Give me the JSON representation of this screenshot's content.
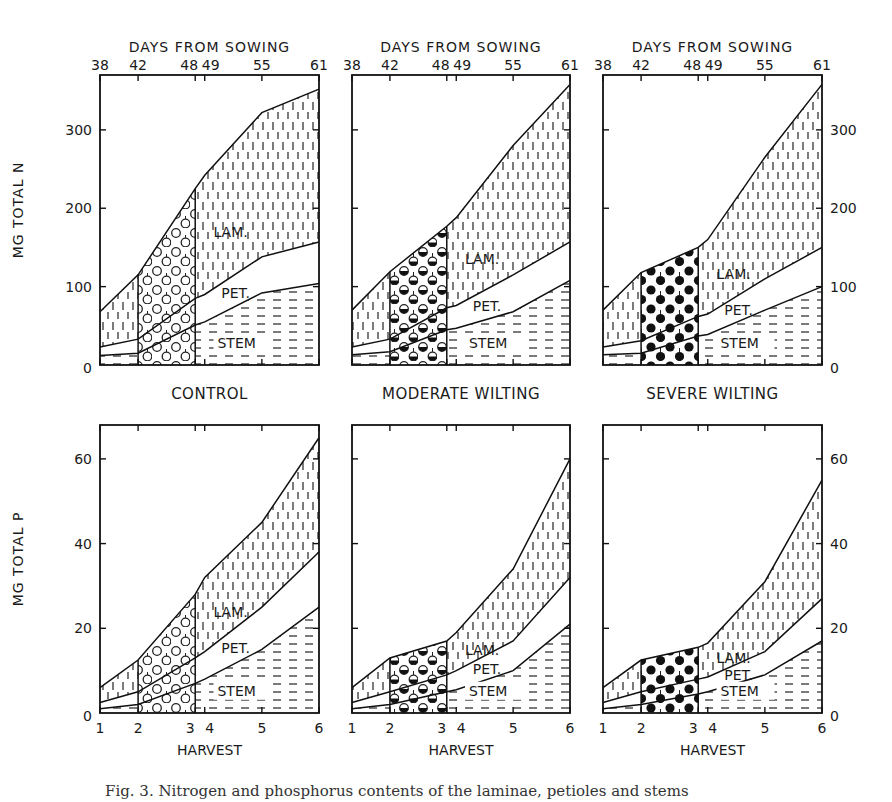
{
  "figure": {
    "treatments": [
      "CONTROL",
      "MODERATE WILTING",
      "SEVERE WILTING"
    ],
    "top_axis_title": "DAYS FROM SOWING",
    "top_axis_ticks": [
      "38",
      "42",
      "48",
      "49",
      "55",
      "61"
    ],
    "bottom_axis_title": "HARVEST",
    "bottom_axis_ticks": [
      "1",
      "2",
      "3",
      "4",
      "5",
      "6"
    ],
    "region_labels": {
      "lamina": "LAM.",
      "petiole": "PET.",
      "stem": "STEM"
    },
    "n_ylabel": "MG   TOTAL   N",
    "p_ylabel": "MG   TOTAL   P",
    "n_yticks": [
      "0",
      "100",
      "200",
      "300"
    ],
    "p_yticks": [
      "0",
      "20",
      "40",
      "60"
    ],
    "caption_partial": "Fig. 3. Nitrogen and phosphorus contents of the laminae, petioles and stems"
  },
  "chart_data": [
    {
      "type": "area",
      "title": "CONTROL",
      "nutrient": "N",
      "xlabel_top": "DAYS FROM SOWING",
      "xlabel": "HARVEST",
      "ylabel": "MG TOTAL N",
      "x": [
        1,
        2,
        3,
        4,
        5,
        6
      ],
      "days_from_sowing": [
        38,
        42,
        48,
        49,
        55,
        61
      ],
      "ylim": [
        0,
        370
      ],
      "stacked": true,
      "wilting_period_harvests": [
        2,
        3
      ],
      "series": [
        {
          "name": "STEM",
          "cumulative_top": [
            12,
            15,
            51,
            55,
            92,
            104
          ]
        },
        {
          "name": "PET.",
          "cumulative_top": [
            23,
            33,
            85,
            90,
            138,
            157
          ]
        },
        {
          "name": "LAM.",
          "cumulative_top": [
            68,
            115,
            225,
            242,
            322,
            352
          ]
        }
      ]
    },
    {
      "type": "area",
      "title": "MODERATE WILTING",
      "nutrient": "N",
      "xlabel_top": "DAYS FROM SOWING",
      "xlabel": "HARVEST",
      "ylabel": "MG TOTAL N",
      "x": [
        1,
        2,
        3,
        4,
        5,
        6
      ],
      "days_from_sowing": [
        38,
        42,
        48,
        49,
        55,
        61
      ],
      "ylim": [
        0,
        370
      ],
      "stacked": true,
      "wilting_period_harvests": [
        2,
        3
      ],
      "series": [
        {
          "name": "STEM",
          "cumulative_top": [
            13,
            17,
            45,
            47,
            68,
            108
          ]
        },
        {
          "name": "PET.",
          "cumulative_top": [
            23,
            33,
            73,
            76,
            115,
            157
          ]
        },
        {
          "name": "LAM.",
          "cumulative_top": [
            70,
            119,
            177,
            188,
            280,
            358
          ]
        }
      ]
    },
    {
      "type": "area",
      "title": "SEVERE WILTING",
      "nutrient": "N",
      "xlabel_top": "DAYS FROM SOWING",
      "xlabel": "HARVEST",
      "ylabel": "MG TOTAL N",
      "x": [
        1,
        2,
        3,
        4,
        5,
        6
      ],
      "days_from_sowing": [
        38,
        42,
        48,
        49,
        55,
        61
      ],
      "ylim": [
        0,
        370
      ],
      "stacked": true,
      "wilting_period_harvests": [
        2,
        3
      ],
      "series": [
        {
          "name": "STEM",
          "cumulative_top": [
            13,
            15,
            37,
            39,
            70,
            100
          ]
        },
        {
          "name": "PET.",
          "cumulative_top": [
            23,
            31,
            62,
            65,
            110,
            150
          ]
        },
        {
          "name": "LAM.",
          "cumulative_top": [
            70,
            118,
            150,
            160,
            265,
            358
          ]
        }
      ]
    },
    {
      "type": "area",
      "title": "CONTROL",
      "nutrient": "P",
      "xlabel": "HARVEST",
      "ylabel": "MG TOTAL P",
      "x": [
        1,
        2,
        3,
        4,
        5,
        6
      ],
      "ylim": [
        0,
        68
      ],
      "stacked": true,
      "wilting_period_harvests": [
        2,
        3
      ],
      "series": [
        {
          "name": "STEM",
          "cumulative_top": [
            1,
            2,
            7,
            8,
            15,
            25
          ]
        },
        {
          "name": "PET.",
          "cumulative_top": [
            2.5,
            5,
            13,
            14.5,
            25,
            38
          ]
        },
        {
          "name": "LAM.",
          "cumulative_top": [
            6,
            12.5,
            28,
            32,
            45,
            65
          ]
        }
      ]
    },
    {
      "type": "area",
      "title": "MODERATE WILTING",
      "nutrient": "P",
      "xlabel": "HARVEST",
      "ylabel": "MG TOTAL P",
      "x": [
        1,
        2,
        3,
        4,
        5,
        6
      ],
      "ylim": [
        0,
        68
      ],
      "stacked": true,
      "wilting_period_harvests": [
        2,
        3
      ],
      "series": [
        {
          "name": "STEM",
          "cumulative_top": [
            1,
            2,
            5,
            5.5,
            10,
            21
          ]
        },
        {
          "name": "PET.",
          "cumulative_top": [
            2.5,
            5,
            9,
            10,
            17,
            32
          ]
        },
        {
          "name": "LAM.",
          "cumulative_top": [
            6,
            13,
            17,
            19,
            34,
            60
          ]
        }
      ]
    },
    {
      "type": "area",
      "title": "SEVERE WILTING",
      "nutrient": "P",
      "xlabel": "HARVEST",
      "ylabel": "MG TOTAL P",
      "x": [
        1,
        2,
        3,
        4,
        5,
        6
      ],
      "ylim": [
        0,
        68
      ],
      "stacked": true,
      "wilting_period_harvests": [
        2,
        3
      ],
      "series": [
        {
          "name": "STEM",
          "cumulative_top": [
            1,
            2,
            4.5,
            5,
            9,
            17
          ]
        },
        {
          "name": "PET.",
          "cumulative_top": [
            2.5,
            5,
            8,
            8.5,
            14.5,
            27
          ]
        },
        {
          "name": "LAM.",
          "cumulative_top": [
            6,
            12.5,
            15.5,
            16.5,
            31,
            55
          ]
        }
      ]
    }
  ]
}
